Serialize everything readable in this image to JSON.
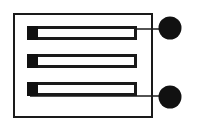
{
  "figure": {
    "canvas": {
      "width": 200,
      "height": 130,
      "background": "#ffffff"
    },
    "colors": {
      "stroke": "#1a1a1a",
      "fill_solid": "#111111",
      "fill_hollow": "#ffffff",
      "background": "#ffffff"
    },
    "substrate_outline": {
      "label": "substrate-outline",
      "x": 14,
      "y": 14,
      "width": 138,
      "height": 103,
      "stroke_width": 2,
      "fill": "none"
    },
    "traces": [
      {
        "id": "trace-1",
        "label": "meander-trace-top",
        "x": 27,
        "y": 26,
        "width": 110,
        "height": 14,
        "stroke_width": 3,
        "cap_side": "left",
        "cap_width": 11
      },
      {
        "id": "trace-2",
        "label": "meander-trace-middle",
        "x": 27,
        "y": 54,
        "width": 110,
        "height": 14,
        "stroke_width": 3,
        "cap_side": "left",
        "cap_width": 11
      },
      {
        "id": "trace-3",
        "label": "meander-trace-bottom",
        "x": 27,
        "y": 82,
        "width": 110,
        "height": 14,
        "stroke_width": 3,
        "cap_side": "left",
        "cap_width": 11
      }
    ],
    "end_caps_right": [
      {
        "id": "cap-right-1",
        "label": "trace-end-cap-upper-right",
        "x": 126,
        "y": 41,
        "width": 11,
        "height": 14
      },
      {
        "id": "cap-right-2",
        "label": "trace-end-cap-lower-right",
        "x": 126,
        "y": 69,
        "width": 11,
        "height": 14
      }
    ],
    "leads": [
      {
        "id": "lead-top",
        "label": "lead-line-top",
        "x1": 30,
        "y1": 29,
        "x2": 168,
        "y2": 29,
        "stroke_width": 1.6
      },
      {
        "id": "lead-bottom",
        "label": "lead-line-bottom",
        "x1": 30,
        "y1": 96,
        "x2": 168,
        "y2": 96,
        "stroke_width": 1.6
      }
    ],
    "contact_pads": [
      {
        "id": "pad-top",
        "label": "contact-pad-top",
        "cx": 170,
        "cy": 28,
        "r": 11.5,
        "fill": "#111111"
      },
      {
        "id": "pad-bottom",
        "label": "contact-pad-bottom",
        "cx": 170,
        "cy": 97,
        "r": 11.5,
        "fill": "#111111"
      }
    ]
  }
}
